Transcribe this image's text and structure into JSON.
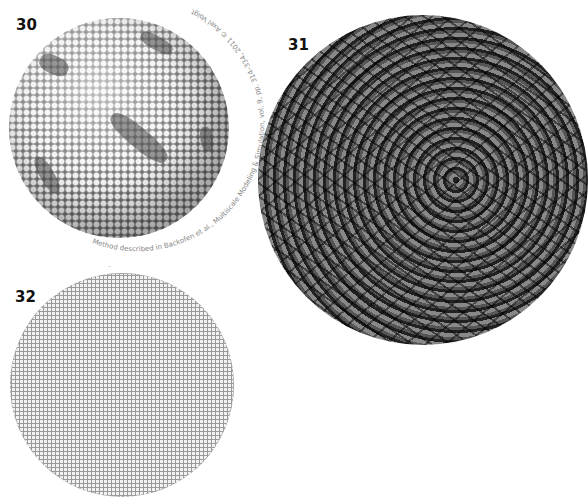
{
  "figures": [
    {
      "number": "30",
      "type": "sphere packing rendering (spheres on a sphere, with darker defect regions)"
    },
    {
      "number": "31",
      "type": "dark hyperbolic/fractal sphere rendering"
    },
    {
      "number": "32",
      "type": "spiral lattice disc plot"
    }
  ],
  "caption_30": "Method described in Backofen et al., Multiscale Modeling & Simulation, vol. 9, pp. 314–334, 2011 © Axel Voigt",
  "label_32_top": "",
  "labels": {
    "n30": "30",
    "n31": "31",
    "n32": "32"
  }
}
